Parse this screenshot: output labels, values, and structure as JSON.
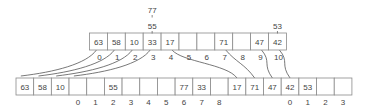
{
  "diagram": {
    "top_array": {
      "cells": [
        "63",
        "58",
        "10",
        "33",
        "17",
        "",
        "",
        "71",
        "",
        "47",
        "42"
      ],
      "indices": [
        "0",
        "1",
        "2",
        "3",
        "4",
        "5",
        "6",
        "7",
        "8",
        "9",
        "10"
      ]
    },
    "top_overflow": [
      {
        "cell_index": 3,
        "values": [
          "55",
          "77"
        ]
      },
      {
        "cell_index": 10,
        "values": [
          "53"
        ]
      }
    ],
    "bottom_array": {
      "cells": [
        "63",
        "58",
        "10",
        "",
        "",
        "55",
        "",
        "",
        "",
        "77",
        "33",
        "",
        "17",
        "71",
        "47",
        "42",
        "53",
        "",
        ""
      ],
      "indices": [
        "",
        "",
        "",
        "0",
        "1",
        "2",
        "3",
        "4",
        "5",
        "6",
        "7",
        "8",
        "",
        "",
        "",
        "0",
        "1",
        "2",
        "3"
      ]
    },
    "links": [
      {
        "from_top": 0,
        "to_bottom": 0
      },
      {
        "from_top": 1,
        "to_bottom": 1
      },
      {
        "from_top": 2,
        "to_bottom": 2
      },
      {
        "from_top": 3,
        "to_bottom": 3
      },
      {
        "from_top": 4,
        "to_bottom": 12
      },
      {
        "from_top": 7,
        "to_bottom": 13
      },
      {
        "from_top": 9,
        "to_bottom": 14
      },
      {
        "from_top": 10,
        "to_bottom": 15
      }
    ]
  }
}
